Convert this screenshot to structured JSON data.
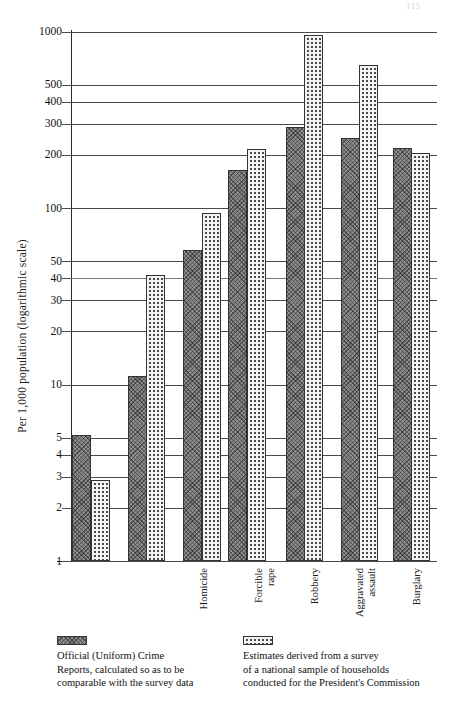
{
  "page": {
    "number": "115"
  },
  "chart_data": {
    "type": "bar",
    "title": "",
    "subtitle": "",
    "xlabel": "",
    "ylabel": "Per 1,000 population (logarithmic scale)",
    "scale": "log",
    "ylim": [
      1,
      1000
    ],
    "grid": true,
    "legend_position": "bottom",
    "ytick_labels": [
      "1000",
      "500",
      "400",
      "300",
      "200",
      "100",
      "50",
      "40",
      "30",
      "20",
      "10",
      "5",
      "4",
      "3",
      "2",
      "1"
    ],
    "ytick_values": [
      1000,
      500,
      400,
      300,
      200,
      100,
      50,
      40,
      30,
      20,
      10,
      5,
      4,
      3,
      2,
      1
    ],
    "categories": [
      "Homicide",
      "Forcible\nrape",
      "Robbery",
      "Aggravated\nassault",
      "Burglary",
      "Larceny",
      "Vehicle\ntheft"
    ],
    "series": [
      {
        "name": "Official (Uniform) Crime Reports, calculated so as to be comparable with the survey data",
        "short_name": "ucr",
        "pattern": "dark-hatch",
        "color": "#8e8e8e",
        "values": [
          5.2,
          11.2,
          58,
          165,
          290,
          250,
          220
        ]
      },
      {
        "name": "Estimates derived from a survey of a national sample of households conducted for the President's Commission",
        "short_name": "survey",
        "pattern": "light-dots",
        "color": "#f3f3f3",
        "values": [
          2.9,
          42,
          94,
          218,
          965,
          650,
          205
        ]
      }
    ]
  },
  "legend": {
    "entries": [
      {
        "swatch": "dark-hatch-swatch",
        "text": "Official (Uniform) Crime\nReports, calculated so as to be\ncomparable with the survey data"
      },
      {
        "swatch": "light-dots-swatch",
        "text": "Estimates derived from a survey\nof a national sample of households\nconducted for the President's Commission"
      }
    ]
  }
}
